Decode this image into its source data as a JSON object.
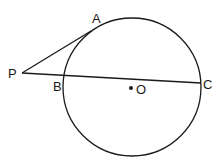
{
  "diagram": {
    "type": "circle-tangent-secant",
    "stroke_color": "#1a1a1a",
    "background": "#ffffff",
    "circle": {
      "center": "O",
      "cx": 132,
      "cy": 87,
      "r": 69
    },
    "points": {
      "P": {
        "label": "P",
        "x": 22,
        "y": 73,
        "label_x": 8,
        "label_y": 78
      },
      "A": {
        "label": "A",
        "x": 91,
        "y": 31,
        "label_x": 92,
        "label_y": 23
      },
      "B": {
        "label": "B",
        "x": 64,
        "y": 75,
        "label_x": 53,
        "label_y": 91
      },
      "C": {
        "label": "C",
        "x": 201,
        "y": 83,
        "label_x": 203,
        "label_y": 89
      },
      "O": {
        "label": "O",
        "x": 131,
        "y": 88,
        "label_x": 136,
        "label_y": 94
      }
    },
    "segments": [
      {
        "name": "tangent-PA",
        "from": "P",
        "to": "A"
      },
      {
        "name": "secant-PC",
        "from": "P",
        "to": "C"
      }
    ]
  }
}
